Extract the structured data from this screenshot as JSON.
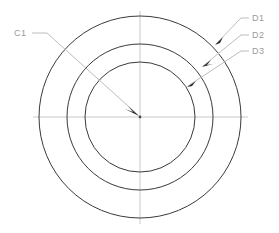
{
  "drawing": {
    "type": "engineering-section-concentric-circles",
    "background_color": "#ffffff",
    "circle_stroke_color": "#3a3a3a",
    "centerline_color": "#c9c9c9",
    "leader_color": "#bdbdbd",
    "label_color": "#9a9a9a",
    "center": {
      "x": 140,
      "y": 117
    },
    "circles": [
      {
        "id": "D1",
        "radius": 101,
        "label": "D1"
      },
      {
        "id": "D2",
        "radius": 73,
        "label": "D2"
      },
      {
        "id": "D3",
        "radius": 55,
        "label": "D3"
      }
    ],
    "centerlines": {
      "horizontal": {
        "x1": 33,
        "y1": 117,
        "x2": 248,
        "y2": 117
      },
      "vertical": {
        "x1": 140,
        "y1": 11,
        "x2": 140,
        "y2": 224
      }
    },
    "labels": [
      {
        "name": "C1",
        "text": "C1",
        "text_x": 14,
        "text_y": 36,
        "leader": "M32,33 L47,33 L138,115",
        "arrow_at": {
          "x": 138,
          "y": 115
        },
        "points_to": "center-point"
      },
      {
        "name": "D1",
        "text": "D1",
        "text_x": 252,
        "text_y": 21,
        "leader": "M249,18 L241,18 L216,44",
        "arrow_at": {
          "x": 216,
          "y": 44
        },
        "points_to": "outer-circle"
      },
      {
        "name": "D2",
        "text": "D2",
        "text_x": 252,
        "text_y": 38,
        "leader": "M249,35 L241,35 L203,66",
        "arrow_at": {
          "x": 203,
          "y": 66
        },
        "points_to": "middle-circle"
      },
      {
        "name": "D3",
        "text": "D3",
        "text_x": 252,
        "text_y": 54,
        "leader": "M249,51 L241,51 L188,86",
        "arrow_at": {
          "x": 188,
          "y": 86
        },
        "points_to": "inner-circle"
      }
    ]
  }
}
